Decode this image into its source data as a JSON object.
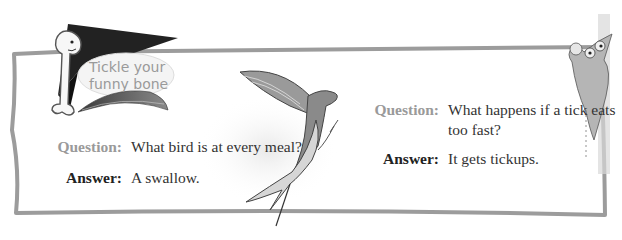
{
  "banner": {
    "line1": "Tickle your",
    "line2": "funny bone"
  },
  "jokes": [
    {
      "question_label": "Question:",
      "question": "What bird is at every meal?",
      "answer_label": "Answer:",
      "answer": "A swallow."
    },
    {
      "question_label": "Question:",
      "question": "What happens if a tick eats too fast?",
      "answer_label": "Answer:",
      "answer": "It gets tickups."
    }
  ],
  "colors": {
    "frame": "#9c9c9c",
    "question_label": "#9a9a9a",
    "answer_label": "#222222",
    "body_text": "#333333"
  }
}
